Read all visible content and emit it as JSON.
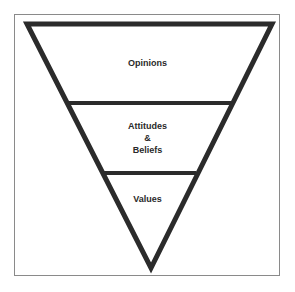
{
  "diagram": {
    "type": "inverted-pyramid",
    "colors": {
      "stroke": "#2b2b2b",
      "frame": "#8a8a8a",
      "background": "#ffffff",
      "text": "#2a2a2a"
    },
    "levels": [
      {
        "label": "Opinions"
      },
      {
        "label_lines": [
          "Attitudes",
          "&",
          "Beliefs"
        ]
      },
      {
        "label": "Values"
      }
    ]
  }
}
